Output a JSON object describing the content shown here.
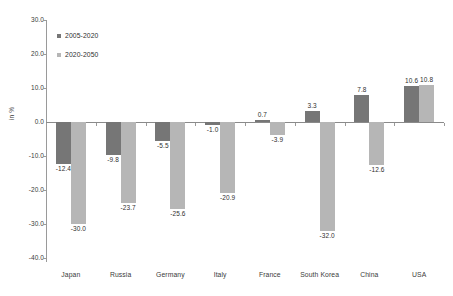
{
  "chart_data": {
    "type": "bar",
    "title": "",
    "xlabel": "",
    "ylabel": "in %",
    "ylim": [
      -40.0,
      30.0
    ],
    "ytick_step": 10.0,
    "grid": false,
    "legend_position": "top-left",
    "categories": [
      "Japan",
      "Russia",
      "Germany",
      "Italy",
      "France",
      "South Korea",
      "China",
      "USA"
    ],
    "ytick_labels": [
      "30.0",
      "20.0",
      "10.0",
      "0.0",
      "-10.0",
      "-20.0",
      "-30.0",
      "-40.0"
    ],
    "ytick_values": [
      30.0,
      20.0,
      10.0,
      0.0,
      -10.0,
      -20.0,
      -30.0,
      -40.0
    ],
    "series": [
      {
        "name": "2005-2020",
        "color": "#767676",
        "values": [
          -12.4,
          -9.8,
          -5.5,
          -1.0,
          0.7,
          3.3,
          7.8,
          10.6
        ],
        "labels": [
          "-12.4",
          "-9.8",
          "-5.5",
          "-1.0",
          "0.7",
          "3.3",
          "7.8",
          "10.6"
        ]
      },
      {
        "name": "2020-2050",
        "color": "#b6b6b6",
        "values": [
          -30.0,
          -23.7,
          -25.6,
          -20.9,
          -3.9,
          -32.0,
          -12.6,
          10.8
        ],
        "labels": [
          "-30.0",
          "-23.7",
          "-25.6",
          "-20.9",
          "-3.9",
          "-32.0",
          "-12.6",
          "10.8"
        ]
      }
    ]
  },
  "legend": {
    "items": [
      {
        "label": "2005-2020",
        "color": "#767676"
      },
      {
        "label": "2020-2050",
        "color": "#b6b6b6"
      }
    ]
  },
  "axis": {
    "y_title": "in %"
  },
  "caption": {
    "text": ""
  }
}
